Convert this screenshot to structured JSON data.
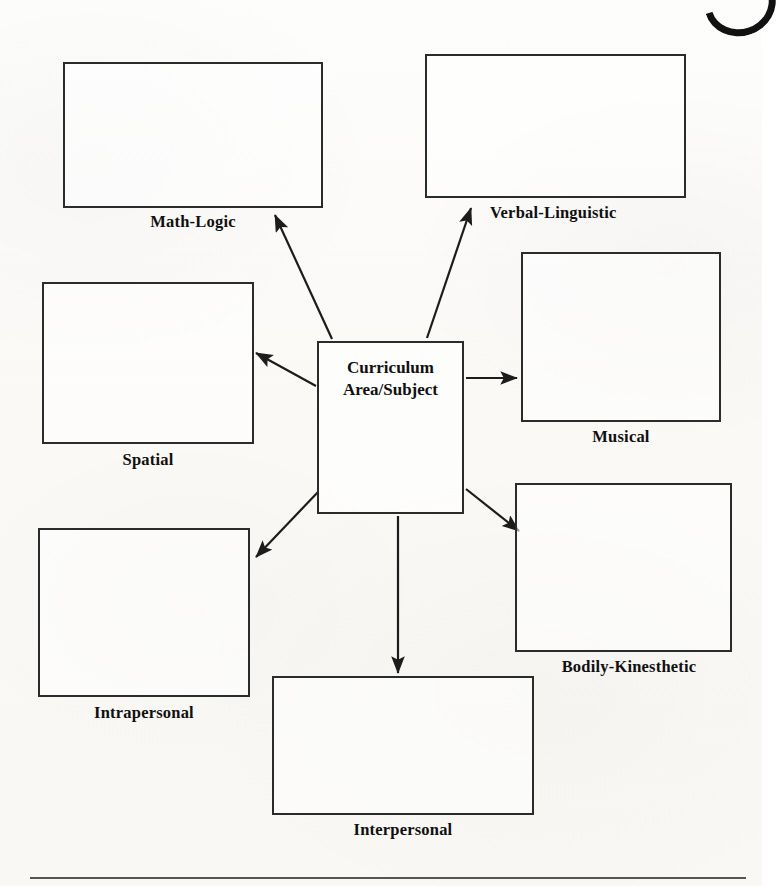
{
  "diagram": {
    "center": {
      "label": "Curriculum\nArea/Subject"
    },
    "nodes": [
      {
        "id": "math-logic",
        "label": "Math-Logic"
      },
      {
        "id": "verbal-linguistic",
        "label": "Verbal-Linguistic"
      },
      {
        "id": "spatial",
        "label": "Spatial"
      },
      {
        "id": "musical",
        "label": "Musical"
      },
      {
        "id": "intrapersonal",
        "label": "Intrapersonal"
      },
      {
        "id": "bodily-kinesthetic",
        "label": "Bodily-Kinesthetic"
      },
      {
        "id": "interpersonal",
        "label": "Interpersonal"
      }
    ],
    "colors": {
      "ink": "#2b2b2b",
      "paper": "#fbfaf8",
      "rule": "#555555"
    },
    "icons": {
      "corner": "crescent-mark-icon"
    }
  }
}
